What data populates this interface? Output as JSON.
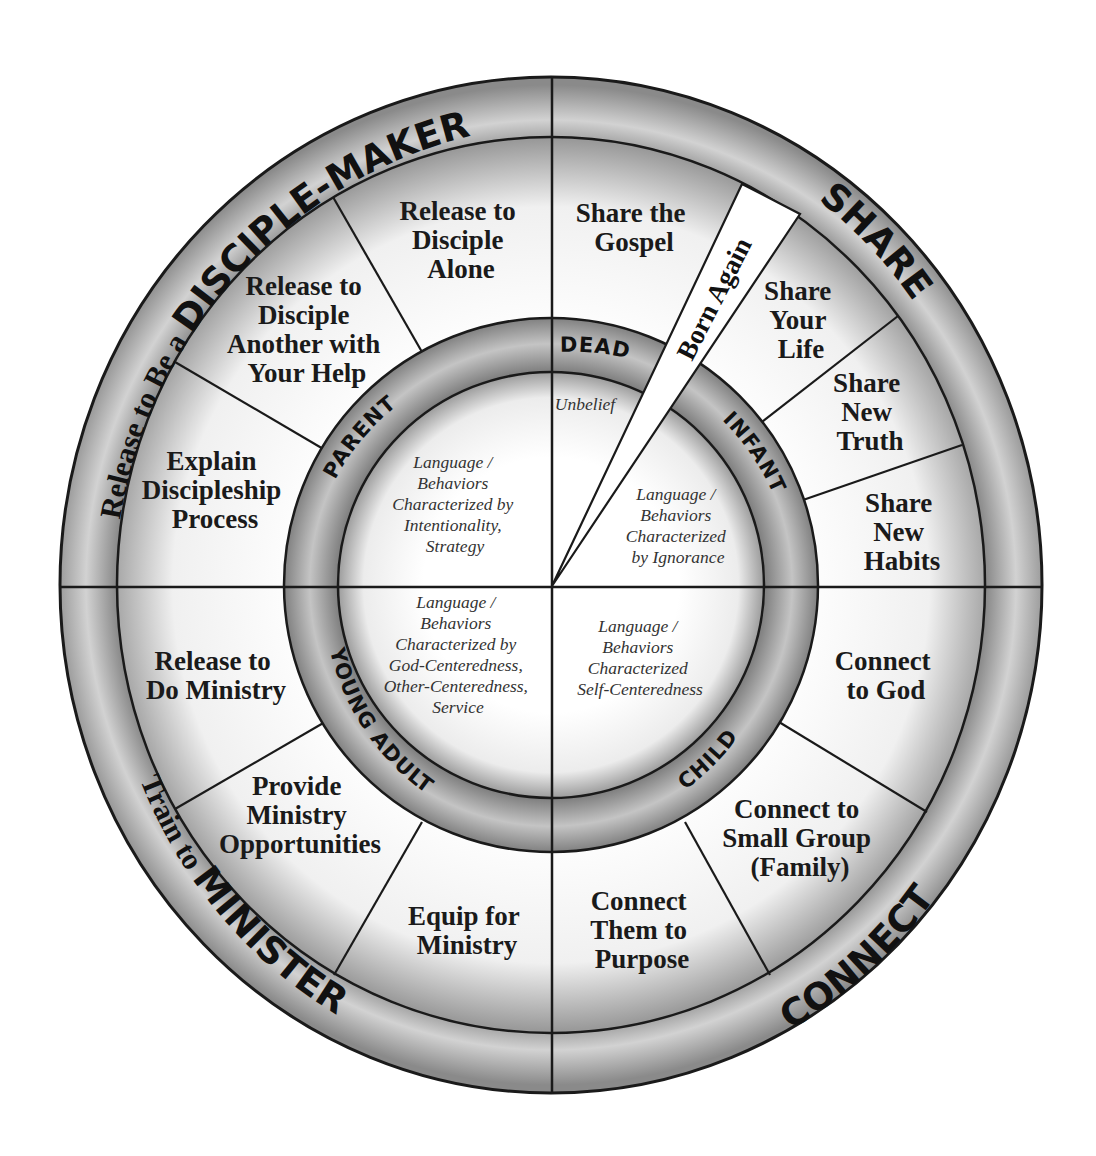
{
  "diagram": {
    "type": "discipleship-wheel",
    "colors": {
      "line": "#1a1a1a",
      "band_dark": "#8a8a8a",
      "band_light": "#e6e6e6",
      "paper": "#ffffff"
    },
    "outer_band": {
      "top_left": {
        "prefix": "Release to Be a ",
        "emphasis": "DISCIPLE-MAKER"
      },
      "top_right": {
        "emphasis": "SHARE"
      },
      "bottom_right": {
        "emphasis": "CONNECT"
      },
      "bottom_left": {
        "prefix": "Train to ",
        "emphasis": "MINISTER"
      }
    },
    "segments": {
      "release_alone": [
        "Release to",
        "Disciple",
        "Alone"
      ],
      "release_with_help": [
        "Release to",
        "Disciple",
        "Another with",
        "Your Help"
      ],
      "explain_process": [
        "Explain",
        "Discipleship",
        "Process"
      ],
      "share_gospel": [
        "Share the",
        "Gospel"
      ],
      "share_life": [
        "Share",
        "Your",
        "Life"
      ],
      "share_truth": [
        "Share",
        "New",
        "Truth"
      ],
      "share_habits": [
        "Share",
        "New",
        "Habits"
      ],
      "release_ministry": [
        "Release to",
        "Do Ministry"
      ],
      "provide_opportunities": [
        "Provide",
        "Ministry",
        "Opportunities"
      ],
      "equip_ministry": [
        "Equip for",
        "Ministry"
      ],
      "connect_god": [
        "Connect",
        "to God"
      ],
      "connect_group": [
        "Connect to",
        "Small Group",
        "(Family)"
      ],
      "connect_purpose": [
        "Connect",
        "Them to",
        "Purpose"
      ]
    },
    "born_again": "Born Again",
    "stages": {
      "dead": "DEAD",
      "infant": "INFANT",
      "child": "CHILD",
      "young_adult": "YOUNG ADULT",
      "parent": "PARENT"
    },
    "core": {
      "unbelief": "Unbelief",
      "parent": [
        "Language /",
        "Behaviors",
        "Characterized by",
        "Intentionality,",
        "Strategy"
      ],
      "infant": [
        "Language /",
        "Behaviors",
        "Characterized",
        "by Ignorance"
      ],
      "young_adult": [
        "Language /",
        "Behaviors",
        "Characterized by",
        "God-Centeredness,",
        "Other-Centeredness,",
        "Service"
      ],
      "child": [
        "Language /",
        "Behaviors",
        "Characterized",
        "Self-Centeredness"
      ]
    }
  }
}
